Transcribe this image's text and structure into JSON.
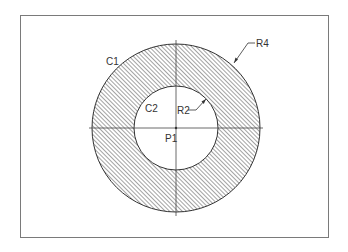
{
  "diagram": {
    "type": "cad-section-annulus",
    "frame": {
      "x": 20,
      "y": 15,
      "width": 308,
      "height": 222,
      "stroke": "#7a7a7a"
    },
    "center": {
      "x": 176,
      "y": 128
    },
    "outer_circle": {
      "label": "C1",
      "radius": 84
    },
    "inner_circle": {
      "label": "C2",
      "radius": 42
    },
    "hatch": {
      "angle_deg": 45,
      "spacing": 3,
      "color": "#555555"
    },
    "centerlines": {
      "h_from": 89,
      "h_to": 263,
      "v_from": 40,
      "v_to": 216,
      "color": "#444444"
    },
    "labels": {
      "c1": "C1",
      "c2": "C2",
      "r4": "R4",
      "r2": "R2",
      "p1": "P1"
    }
  }
}
